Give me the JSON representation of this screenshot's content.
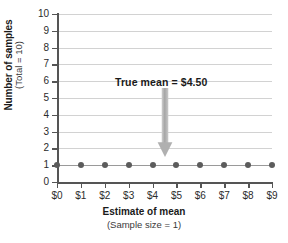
{
  "chart_data": {
    "type": "scatter",
    "title": "",
    "xlabel": "Estimate of mean",
    "xlabel_sub": "(Sample size = 1)",
    "ylabel": "Number of samples",
    "ylabel_sub": "(Total = 10)",
    "x_tick_labels": [
      "$0",
      "$1",
      "$2",
      "$3",
      "$4",
      "$5",
      "$6",
      "$7",
      "$8",
      "$9"
    ],
    "y_tick_labels": [
      "0",
      "1",
      "2",
      "3",
      "4",
      "5",
      "6",
      "7",
      "8",
      "9",
      "10"
    ],
    "xlim": [
      0,
      9
    ],
    "ylim": [
      0,
      10
    ],
    "grid": "horizontal",
    "legend": "none",
    "series": [
      {
        "name": "samples",
        "x": [
          0,
          1,
          2,
          3,
          4,
          5,
          6,
          7,
          8,
          9
        ],
        "values": [
          1,
          1,
          1,
          1,
          1,
          1,
          1,
          1,
          1,
          1
        ]
      }
    ],
    "annotations": [
      {
        "text": "True mean  =  $4.50",
        "x": 4.5,
        "y": 6,
        "marker": "down-arrow",
        "arrow_from_y": 5.6,
        "arrow_to_y": 1.2
      }
    ],
    "colors": {
      "point": "#5c5c5c",
      "connector": "#9a9a9a",
      "gridline": "#d2d2d2",
      "axis": "#555555",
      "arrow": "#a8a8a8",
      "text": "#1a1a1a",
      "background": "#ffffff"
    }
  }
}
